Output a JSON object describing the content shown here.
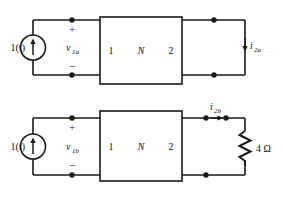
{
  "figure": {
    "line_color": "#1a1a1a",
    "background": "#ffffff"
  },
  "circuits": [
    {
      "id": "circuit-a",
      "source": {
        "label": "1(t)",
        "type": "current-source",
        "direction": "up"
      },
      "port1": {
        "plus": "+",
        "minus": "−",
        "voltage_label": "v",
        "voltage_sub": "1a"
      },
      "twoport": {
        "left_label": "1",
        "center_label": "N",
        "right_label": "2"
      },
      "port2": {
        "current_label": "i",
        "current_sub": "2a",
        "current_direction": "down",
        "termination": "open-circuit"
      }
    },
    {
      "id": "circuit-b",
      "source": {
        "label": "1(t)",
        "type": "current-source",
        "direction": "up"
      },
      "port1": {
        "plus": "+",
        "minus": "−",
        "voltage_label": "v",
        "voltage_sub": "1b"
      },
      "twoport": {
        "left_label": "1",
        "center_label": "N",
        "right_label": "2"
      },
      "port2": {
        "current_label": "i",
        "current_sub": "2b",
        "current_direction": "right",
        "termination": "resistor"
      },
      "resistor": {
        "value": "4",
        "unit": "Ω",
        "label": "4 Ω"
      }
    }
  ]
}
